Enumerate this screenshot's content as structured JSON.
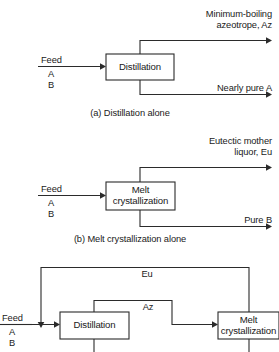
{
  "figure": {
    "line_color": "#2b2b2b",
    "text_color": "#1a1a1a",
    "background": "#ffffff"
  },
  "panel_a": {
    "caption": "(a) Distillation alone",
    "unit": "Distillation",
    "feed_label": "Feed",
    "feed_components": [
      "A",
      "B"
    ],
    "top_product_line1": "Minimum-boiling",
    "top_product_line2": "azeotrope, Az",
    "bottom_product": "Nearly pure A"
  },
  "panel_b": {
    "caption": "(b) Melt crystallization alone",
    "unit_line1": "Melt",
    "unit_line2": "crystallization",
    "feed_label": "Feed",
    "feed_components": [
      "A",
      "B"
    ],
    "top_product_line1": "Eutectic mother",
    "top_product_line2": "liquor, Eu",
    "bottom_product": "Pure B"
  },
  "panel_c": {
    "unit_left": "Distillation",
    "unit_right_line1": "Melt",
    "unit_right_line2": "crystallization",
    "feed_label": "Feed",
    "feed_components": [
      "A",
      "B"
    ],
    "recycle_top": "Eu",
    "intermediate": "Az"
  }
}
